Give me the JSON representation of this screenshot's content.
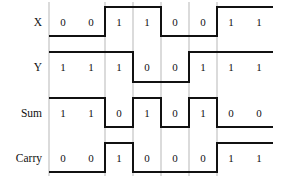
{
  "diagram": {
    "type": "timing",
    "cells": 8,
    "signals": [
      {
        "name": "X",
        "values": [
          0,
          0,
          1,
          1,
          0,
          0,
          1,
          1
        ]
      },
      {
        "name": "Y",
        "values": [
          1,
          1,
          1,
          0,
          0,
          1,
          1,
          1
        ]
      },
      {
        "name": "Sum",
        "values": [
          1,
          1,
          0,
          1,
          0,
          1,
          0,
          0
        ]
      },
      {
        "name": "Carry",
        "values": [
          0,
          0,
          1,
          0,
          0,
          0,
          1,
          1
        ]
      }
    ],
    "colors": {
      "wave": "#111111",
      "grid": "#9a9a9a",
      "text": "#111111",
      "background": "#ffffff"
    }
  }
}
